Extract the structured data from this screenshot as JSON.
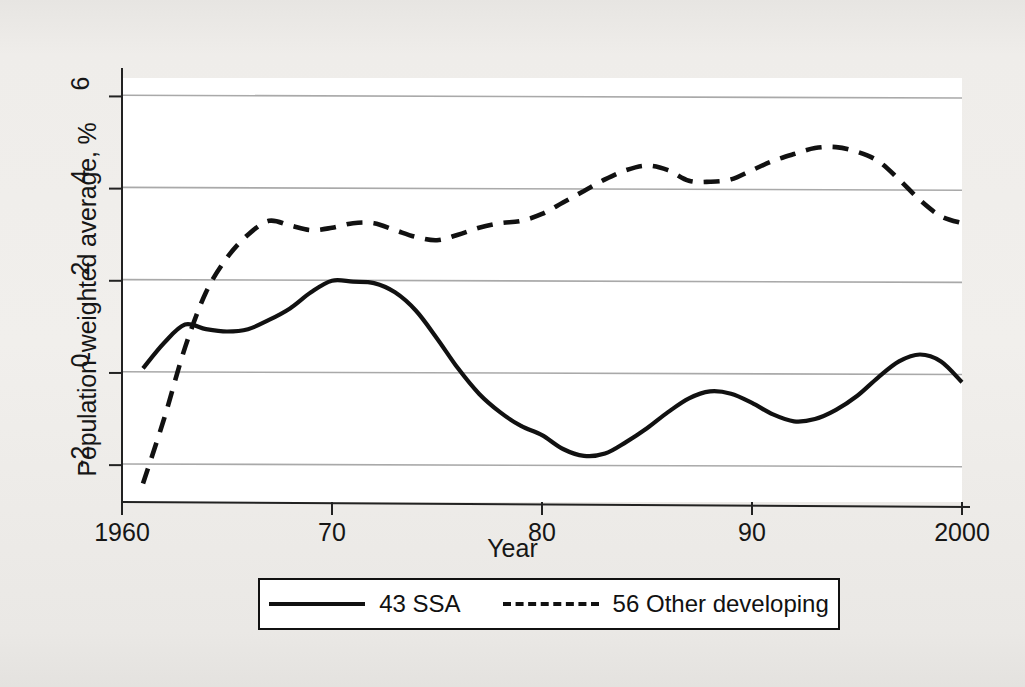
{
  "chart_data": {
    "type": "line",
    "title": "",
    "subtitle": "",
    "xlabel": "Year",
    "ylabel": "Population-weighted average, %",
    "xlim": [
      1960,
      2000
    ],
    "ylim": [
      -2.8,
      6.4
    ],
    "xticks": [
      1960,
      1970,
      1980,
      1990,
      2000
    ],
    "xticklabels": [
      "1960",
      "70",
      "80",
      "90",
      "2000"
    ],
    "yticks": [
      -2,
      0,
      2,
      4,
      6
    ],
    "yticklabels": [
      "-2",
      "0",
      "2",
      "4",
      "6"
    ],
    "grid": "horizontal",
    "grid_color": "#a9a9a9",
    "legend_position": "below-axes",
    "line_color": "#111111",
    "series": [
      {
        "name": "43 SSA",
        "style": "solid",
        "x": [
          1961,
          1962,
          1963,
          1964,
          1965,
          1966,
          1967,
          1968,
          1969,
          1970,
          1971,
          1972,
          1973,
          1974,
          1975,
          1976,
          1977,
          1978,
          1979,
          1980,
          1981,
          1982,
          1983,
          1984,
          1985,
          1986,
          1987,
          1988,
          1989,
          1990,
          1991,
          1992,
          1993,
          1994,
          1995,
          1996,
          1997,
          1998,
          1999,
          2000
        ],
        "values": [
          0.1,
          0.65,
          1.05,
          0.95,
          0.9,
          0.95,
          1.15,
          1.4,
          1.75,
          2.0,
          1.98,
          1.95,
          1.75,
          1.35,
          0.75,
          0.1,
          -0.45,
          -0.85,
          -1.15,
          -1.35,
          -1.65,
          -1.8,
          -1.75,
          -1.5,
          -1.2,
          -0.85,
          -0.55,
          -0.4,
          -0.45,
          -0.65,
          -0.9,
          -1.05,
          -1.0,
          -0.8,
          -0.5,
          -0.1,
          0.25,
          0.4,
          0.25,
          -0.2
        ]
      },
      {
        "name": "56 Other developing",
        "style": "dashed",
        "x": [
          1961,
          1962,
          1963,
          1964,
          1965,
          1966,
          1967,
          1968,
          1969,
          1970,
          1971,
          1972,
          1973,
          1974,
          1975,
          1976,
          1977,
          1978,
          1979,
          1980,
          1981,
          1982,
          1983,
          1984,
          1985,
          1986,
          1987,
          1988,
          1989,
          1990,
          1991,
          1992,
          1993,
          1994,
          1995,
          1996,
          1997,
          1998,
          1999,
          2000
        ],
        "values": [
          -2.4,
          -1.0,
          0.55,
          1.75,
          2.5,
          3.0,
          3.3,
          3.2,
          3.1,
          3.15,
          3.25,
          3.25,
          3.1,
          2.95,
          2.88,
          3.0,
          3.15,
          3.25,
          3.3,
          3.45,
          3.7,
          3.95,
          4.2,
          4.4,
          4.5,
          4.4,
          4.17,
          4.15,
          4.2,
          4.4,
          4.6,
          4.75,
          4.88,
          4.9,
          4.8,
          4.6,
          4.2,
          3.75,
          3.4,
          3.25
        ]
      }
    ]
  },
  "legend": {
    "items": [
      {
        "label": "43 SSA",
        "style": "solid"
      },
      {
        "label": "56 Other developing",
        "style": "dashed"
      }
    ]
  }
}
